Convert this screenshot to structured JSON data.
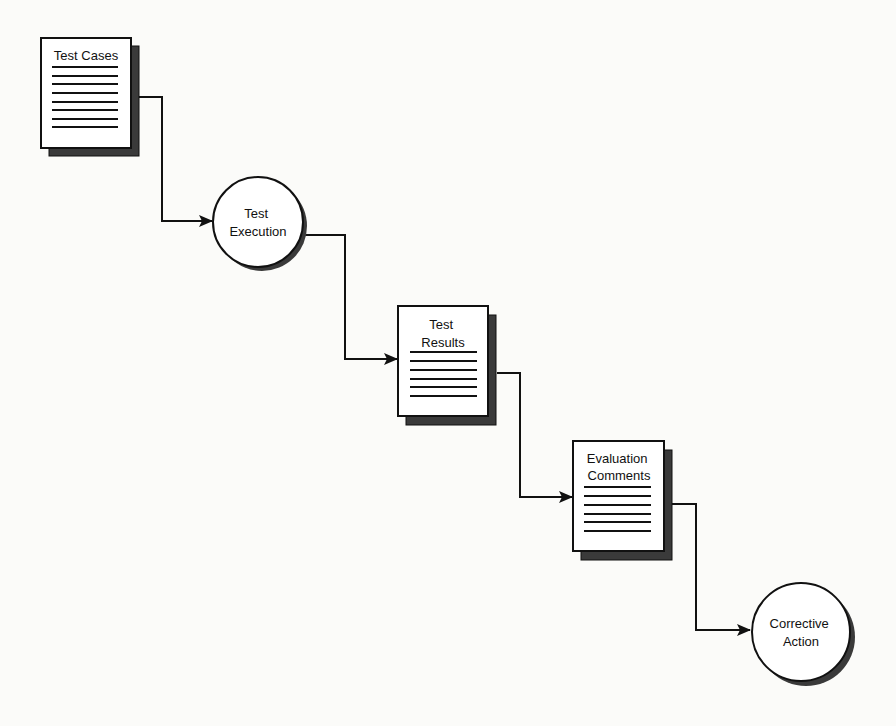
{
  "diagram": {
    "type": "flowchart",
    "colors": {
      "background": "#fbfbf9",
      "stroke": "#111111",
      "fill": "#ffffff",
      "shadow": "#3a3a3a"
    },
    "nodes": [
      {
        "id": "test-cases",
        "shape": "document",
        "lines": [
          "Test Cases"
        ],
        "rule_count": 8
      },
      {
        "id": "test-execution",
        "shape": "circle",
        "lines": [
          "Test",
          "Execution"
        ]
      },
      {
        "id": "test-results",
        "shape": "document",
        "lines": [
          "Test",
          "Results"
        ],
        "rule_count": 6
      },
      {
        "id": "evaluation-comments",
        "shape": "document",
        "lines": [
          "Evaluation",
          "Comments"
        ],
        "rule_count": 6
      },
      {
        "id": "corrective-action",
        "shape": "circle",
        "lines": [
          "Corrective",
          "Action"
        ]
      }
    ],
    "edges": [
      {
        "from": "test-cases",
        "to": "test-execution"
      },
      {
        "from": "test-execution",
        "to": "test-results"
      },
      {
        "from": "test-results",
        "to": "evaluation-comments"
      },
      {
        "from": "evaluation-comments",
        "to": "corrective-action"
      }
    ]
  }
}
